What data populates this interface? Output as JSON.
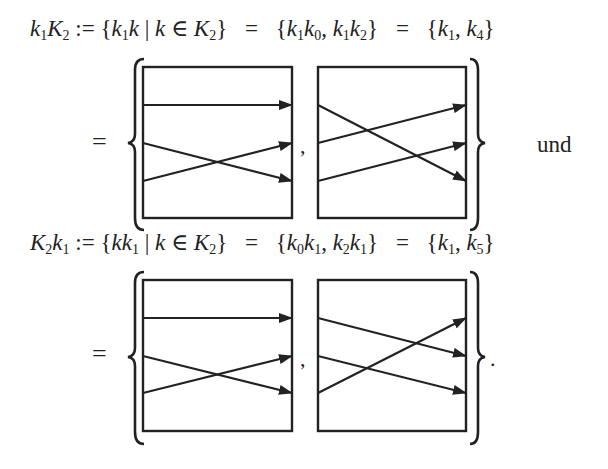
{
  "equations": [
    {
      "id": "k1K2",
      "lhs": "k₁K₂",
      "def": ":=",
      "set_builder": "{k₁k | k ∈ K₂}",
      "expansion": "{k₁k₀, k₁k₂}",
      "result": "{k₁, k₄}",
      "equals_sign": "=",
      "diagrams": [
        {
          "name": "k1",
          "arrows": [
            [
              1,
              1
            ],
            [
              2,
              3
            ],
            [
              3,
              2
            ]
          ]
        },
        {
          "name": "k4",
          "arrows": [
            [
              1,
              3
            ],
            [
              2,
              1
            ],
            [
              3,
              2
            ]
          ]
        }
      ],
      "separator": ",",
      "trailing_word": "und"
    },
    {
      "id": "K2k1",
      "lhs": "K₂k₁",
      "def": ":=",
      "set_builder": "{kk₁ | k ∈ K₂}",
      "expansion": "{k₀k₁, k₂k₁}",
      "result": "{k₁, k₅}",
      "equals_sign": "=",
      "diagrams": [
        {
          "name": "k1",
          "arrows": [
            [
              1,
              1
            ],
            [
              2,
              3
            ],
            [
              3,
              2
            ]
          ]
        },
        {
          "name": "k5",
          "arrows": [
            [
              1,
              2
            ],
            [
              2,
              3
            ],
            [
              3,
              1
            ]
          ]
        }
      ],
      "separator": ",",
      "trailing_punct": "."
    }
  ],
  "text": {
    "eq1": {
      "a": "k",
      "a_sub": "1",
      "b": "K",
      "b_sub": "2",
      "def": ":=",
      "sb_open": "{",
      "sb1": "k",
      "sb1_sub": "1",
      "sb2": "k",
      "bar": "|",
      "sb3": "k",
      "in": "∈",
      "sb4": "K",
      "sb4_sub": "2",
      "sb_close": "}",
      "eq": "=",
      "ex_open": "{",
      "ex1": "k",
      "ex1_sub": "1",
      "ex2": "k",
      "ex2_sub": "0",
      "comma": ",",
      "ex3": "k",
      "ex3_sub": "1",
      "ex4": "k",
      "ex4_sub": "2",
      "ex_close": "}",
      "eq2": "=",
      "r_open": "{",
      "r1": "k",
      "r1_sub": "1",
      "r_comma": ",",
      "r2": "k",
      "r2_sub": "4",
      "r_close": "}"
    },
    "eq2": {
      "a": "K",
      "a_sub": "2",
      "b": "k",
      "b_sub": "1",
      "def": ":=",
      "sb_open": "{",
      "sb1": "k",
      "sb2": "k",
      "sb2_sub": "1",
      "bar": "|",
      "sb3": "k",
      "in": "∈",
      "sb4": "K",
      "sb4_sub": "2",
      "sb_close": "}",
      "eq": "=",
      "ex_open": "{",
      "ex1": "k",
      "ex1_sub": "0",
      "ex2": "k",
      "ex2_sub": "1",
      "comma": ",",
      "ex3": "k",
      "ex3_sub": "2",
      "ex4": "k",
      "ex4_sub": "1",
      "ex_close": "}",
      "eq2": "=",
      "r_open": "{",
      "r1": "k",
      "r1_sub": "1",
      "r_comma": ",",
      "r2": "k",
      "r2_sub": "5",
      "r_close": "}"
    },
    "equals": "=",
    "und": "und",
    "comma": ",",
    "period": "."
  },
  "colors": {
    "ink": "#222222",
    "background": "#ffffff"
  }
}
